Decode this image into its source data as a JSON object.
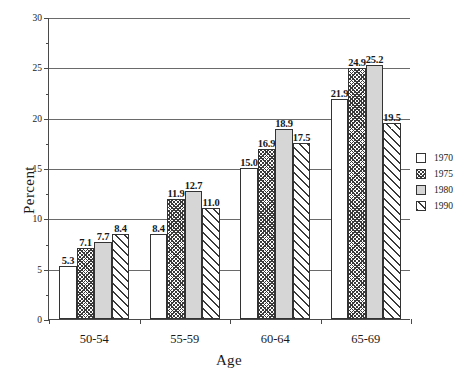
{
  "chart_data": {
    "type": "bar",
    "title": "",
    "xlabel": "Age",
    "ylabel": "Percent",
    "categories": [
      "50-54",
      "55-59",
      "60-64",
      "65-69"
    ],
    "series": [
      {
        "name": "1970",
        "values": [
          5.3,
          8.4,
          15.0,
          21.9
        ],
        "pattern": "solid-white",
        "color": "#ffffff"
      },
      {
        "name": "1975",
        "values": [
          7.1,
          11.9,
          16.9,
          24.9
        ],
        "pattern": "cross-hatch",
        "color": "#3a3a3a"
      },
      {
        "name": "1980",
        "values": [
          7.7,
          12.7,
          18.9,
          25.2
        ],
        "pattern": "solid-gray",
        "color": "#d6d6d6"
      },
      {
        "name": "1990",
        "values": [
          8.4,
          11.0,
          17.5,
          19.5
        ],
        "pattern": "diagonal-stripe",
        "color": "#3a3a3a"
      }
    ],
    "data_labels": [
      [
        "5.3",
        "7.1",
        "7.7",
        "8.4"
      ],
      [
        "8.4",
        "11.9",
        "12.7",
        "11.0"
      ],
      [
        "15.0",
        "16.9",
        "18.9",
        "17.5"
      ],
      [
        "21.9",
        "24.9",
        "25.2",
        "19.5"
      ]
    ],
    "ylim": [
      0,
      30
    ],
    "y_major_ticks": [
      0,
      5,
      10,
      15,
      20,
      25,
      30
    ],
    "y_minor_ticks": [
      2.5,
      7.5,
      12.5,
      17.5,
      22.5,
      27.5
    ],
    "y_tick_labels": [
      "0",
      "5",
      "10",
      "15",
      "20",
      "25",
      "30"
    ],
    "grid": "horizontal",
    "legend_position": "right",
    "legend_entries": [
      "1970",
      "1975",
      "1980",
      "1990"
    ],
    "axis_color": "#4a4a4a",
    "grid_color": "#6a6a6a",
    "bar_border_color": "#333333"
  }
}
